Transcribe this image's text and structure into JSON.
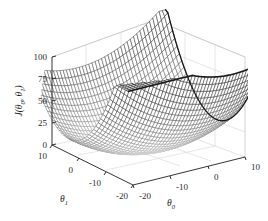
{
  "figure": {
    "kind": "surface-plot",
    "background_color": "#ffffff",
    "axis_color": "#1c1c1c",
    "grid_color": "#c9c9c9",
    "surface_color_low": "#f2f2f2",
    "surface_color_high": "#101010"
  },
  "chart_data": {
    "type": "surface",
    "title": "",
    "subtitle": "",
    "zlabel": "J(θ₀, θ₁)",
    "zlabel_base": "J(",
    "zlabel_theta": "θ",
    "zlabel_sub0": "0",
    "zlabel_mid": ", ",
    "zlabel_sub1": "1",
    "zlabel_close": ")",
    "xlabel": "θ₀",
    "xlabel_base": "θ",
    "xlabel_sub": "0",
    "ylabel": "θ₁",
    "ylabel_base": "θ",
    "ylabel_sub": "1",
    "zticks": [
      0,
      25,
      50,
      75,
      100
    ],
    "ztick_labels": [
      "0",
      "25",
      "50",
      "75",
      "100"
    ],
    "zlim": [
      0,
      100
    ],
    "xticks": [
      -20,
      -10,
      0,
      10
    ],
    "xtick_labels": [
      "-20",
      "-10",
      "0",
      "10"
    ],
    "xlim": [
      -25,
      12
    ],
    "yticks": [
      -20,
      -10,
      0,
      10
    ],
    "ytick_labels": [
      "-20",
      "-10",
      "0",
      "10"
    ],
    "ylim": [
      -25,
      12
    ],
    "grid": true,
    "legend": null,
    "colormap": "gray",
    "surface_formula": "J = a*(theta0 - m0)^2 + b*(theta1 - m1)^2 + c",
    "minimum": {
      "theta0": -5,
      "theta1": -5,
      "J": 0
    },
    "mesh_rows": 42,
    "mesh_cols": 42
  }
}
